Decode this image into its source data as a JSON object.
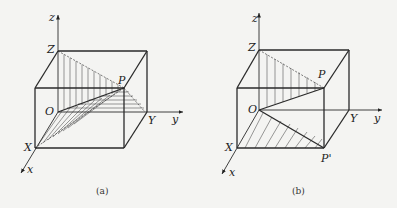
{
  "figure": {
    "panels": [
      {
        "id": "a",
        "caption": "(a)",
        "labels": {
          "z_axis": "z",
          "Z": "Z",
          "P": "P",
          "O": "O",
          "Y": "Y",
          "y_axis": "y",
          "X": "X",
          "x_axis": "x"
        },
        "description": "Rectangular box with point P; hatched triangles OZP (vertical hatch), OPY (horizontal hatch) and OPX (diagonal hatch)"
      },
      {
        "id": "b",
        "caption": "(b)",
        "labels": {
          "z_axis": "z",
          "Z": "Z",
          "P": "P",
          "O": "O",
          "Y": "Y",
          "y_axis": "y",
          "X": "X",
          "P_prime": "P'",
          "x_axis": "x"
        },
        "description": "Rectangular box with point P and its projection P' on the xy-plane; hatched triangle OZP (vertical hatch) and OXP' (diagonal hatch)"
      }
    ]
  }
}
